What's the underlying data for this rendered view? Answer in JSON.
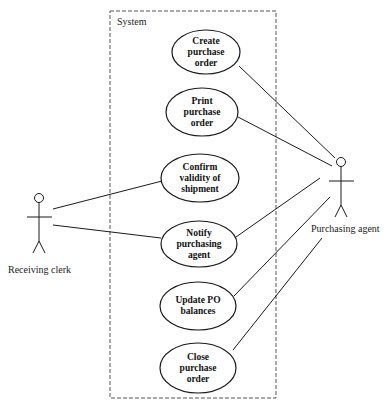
{
  "diagram": {
    "type": "UML use case diagram",
    "system_boundary": {
      "label": "System",
      "x": 110,
      "y": 11,
      "width": 166,
      "height": 387
    },
    "actors": [
      {
        "id": "receiving_clerk",
        "label": "Receiving clerk",
        "head_x": 39,
        "head_y": 198,
        "label_x": 8,
        "label_y": 264
      },
      {
        "id": "purchasing_agent",
        "label": "Purchasing agent",
        "head_x": 341,
        "head_y": 162,
        "label_x": 311,
        "label_y": 223
      }
    ],
    "use_cases": [
      {
        "id": "create_po",
        "label": "Create\npurchase\norder",
        "cx": 206,
        "cy": 52,
        "rx": 34,
        "ry": 22
      },
      {
        "id": "print_po",
        "label": "Print\npurchase\norder",
        "cx": 202,
        "cy": 112,
        "rx": 36,
        "ry": 24
      },
      {
        "id": "confirm_shipment",
        "label": "Confirm\nvalidity of\nshipment",
        "cx": 200,
        "cy": 178,
        "rx": 39,
        "ry": 24
      },
      {
        "id": "notify_agent",
        "label": "Notify\npurchasing\nagent",
        "cx": 199,
        "cy": 244,
        "rx": 38,
        "ry": 23
      },
      {
        "id": "update_po_balances",
        "label": "Update PO\nbalances",
        "cx": 198,
        "cy": 306,
        "rx": 38,
        "ry": 24
      },
      {
        "id": "close_po",
        "label": "Close\npurchase\norder",
        "cx": 198,
        "cy": 368,
        "rx": 38,
        "ry": 25
      }
    ],
    "associations": [
      {
        "from": "receiving_clerk",
        "to": "confirm_shipment",
        "x1": 53,
        "y1": 209,
        "x2": 162,
        "y2": 181
      },
      {
        "from": "receiving_clerk",
        "to": "notify_agent",
        "x1": 53,
        "y1": 225,
        "x2": 161,
        "y2": 238
      },
      {
        "from": "create_po",
        "to": "purchasing_agent",
        "x1": 239,
        "y1": 66,
        "x2": 335,
        "y2": 158
      },
      {
        "from": "print_po",
        "to": "purchasing_agent",
        "x1": 238,
        "y1": 117,
        "x2": 332,
        "y2": 166
      },
      {
        "from": "notify_agent",
        "to": "purchasing_agent",
        "x1": 236,
        "y1": 237,
        "x2": 320,
        "y2": 178
      },
      {
        "from": "update_po_balances",
        "to": "purchasing_agent",
        "x1": 234,
        "y1": 296,
        "x2": 330,
        "y2": 197
      },
      {
        "from": "close_po",
        "to": "purchasing_agent",
        "x1": 233,
        "y1": 350,
        "x2": 322,
        "y2": 238
      }
    ],
    "colors": {
      "stroke": "#1a1a1a",
      "boundary": "#555555",
      "background": "#ffffff"
    }
  }
}
